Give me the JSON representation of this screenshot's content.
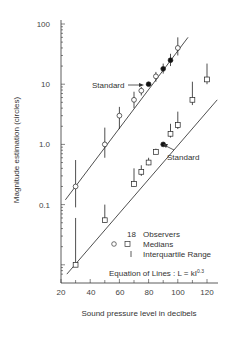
{
  "chart_data": {
    "type": "scatter",
    "title": "",
    "xlabel": "Sound pressure level in decibels",
    "ylabel": "Magnitude estimation (circles)",
    "xlim": [
      20,
      125
    ],
    "ylim": [
      0.007,
      100
    ],
    "yscale": "log",
    "x_ticks": [
      20,
      40,
      60,
      80,
      100,
      120
    ],
    "x_tick_labels": [
      "20",
      "40",
      "60",
      "80",
      "100",
      "120"
    ],
    "y_ticks": [
      100,
      10,
      1.0,
      0.1
    ],
    "y_tick_labels": [
      "100",
      "10",
      "1.0",
      "0.1"
    ],
    "grid": false,
    "series": [
      {
        "name": "Circles (upper)",
        "marker": "circle",
        "points": [
          {
            "x": 30,
            "y": 0.2,
            "filled": false,
            "iqr": [
              0.09,
              0.55
            ]
          },
          {
            "x": 50,
            "y": 1.0,
            "filled": false,
            "iqr": [
              0.6,
              1.9
            ]
          },
          {
            "x": 60,
            "y": 3.0,
            "filled": false,
            "iqr": [
              1.8,
              4.2
            ]
          },
          {
            "x": 70,
            "y": 5.5,
            "filled": false,
            "iqr": [
              4.0,
              7.5
            ]
          },
          {
            "x": 75,
            "y": 7.8,
            "filled": false,
            "iqr": [
              6.5,
              9.0
            ]
          },
          {
            "x": 80,
            "y": 10,
            "filled": true,
            "iqr": null
          },
          {
            "x": 85,
            "y": 13.5,
            "filled": false,
            "iqr": [
              11,
              16
            ]
          },
          {
            "x": 90,
            "y": 18,
            "filled": true,
            "iqr": [
              15,
              22
            ]
          },
          {
            "x": 95,
            "y": 25,
            "filled": true,
            "iqr": [
              20,
              32
            ]
          },
          {
            "x": 100,
            "y": 40,
            "filled": false,
            "iqr": [
              30,
              60
            ]
          }
        ],
        "fit_line": {
          "x": [
            23,
            107
          ],
          "y": [
            0.12,
            60
          ]
        },
        "annotation": "Standard"
      },
      {
        "name": "Squares (lower)",
        "marker": "square",
        "points": [
          {
            "x": 30,
            "y": 0.01,
            "filled": false,
            "iqr": [
              0.01,
              0.06
            ]
          },
          {
            "x": 50,
            "y": 0.055,
            "filled": false,
            "iqr": [
              0.05,
              0.1
            ]
          },
          {
            "x": 70,
            "y": 0.22,
            "filled": false,
            "iqr": [
              0.2,
              0.4
            ]
          },
          {
            "x": 75,
            "y": 0.35,
            "filled": false,
            "iqr": [
              0.3,
              0.45
            ]
          },
          {
            "x": 80,
            "y": 0.5,
            "filled": false,
            "iqr": [
              0.45,
              0.6
            ]
          },
          {
            "x": 85,
            "y": 0.75,
            "filled": false,
            "iqr": [
              0.7,
              0.85
            ]
          },
          {
            "x": 90,
            "y": 1.0,
            "filled": true,
            "iqr": null
          },
          {
            "x": 95,
            "y": 1.5,
            "filled": false,
            "iqr": [
              1.3,
              2.2
            ]
          },
          {
            "x": 100,
            "y": 2.1,
            "filled": false,
            "iqr": [
              1.8,
              3.5
            ]
          },
          {
            "x": 110,
            "y": 5.5,
            "filled": false,
            "iqr": [
              4.5,
              11
            ]
          },
          {
            "x": 120,
            "y": 12,
            "filled": false,
            "iqr": [
              10,
              22
            ]
          }
        ],
        "fit_line": {
          "x": [
            24,
            127
          ],
          "y": [
            0.007,
            5.5
          ]
        },
        "annotation": "Standard"
      }
    ],
    "legend": {
      "position": "lower right",
      "entries": [
        {
          "symbol": "18",
          "label": "Observers"
        },
        {
          "symbol": "O  □",
          "label": "Medians"
        },
        {
          "symbol": "I",
          "label": "Interquartile Range"
        }
      ]
    },
    "equation": "Equation of Lines : L = kI",
    "equation_exponent": "0.3"
  },
  "labels": {
    "ytick_100": "100",
    "ytick_10": "10",
    "ytick_1": "1.0",
    "ytick_01": "0.1",
    "xtick_20": "20",
    "xtick_40": "40",
    "xtick_60": "60",
    "xtick_80": "80",
    "xtick_100": "100",
    "xtick_120": "120",
    "xlabel": "Sound pressure level in decibels",
    "ylabel": "Magnitude estimation (circles)",
    "standard_upper": "Standard",
    "standard_lower": "Standard",
    "legend_count": "18",
    "legend_observers": "Observers",
    "legend_circle": "O",
    "legend_square": "□",
    "legend_medians": "Medians",
    "legend_iqr_symbol": "I",
    "legend_iqr": "Interquartile Range",
    "equation": "Equation of Lines : L = kI",
    "equation_exp": "0.3"
  }
}
